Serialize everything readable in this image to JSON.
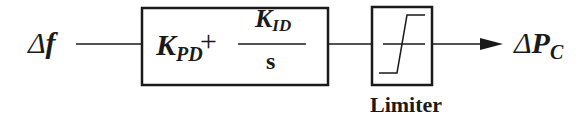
{
  "diagram": {
    "type": "block-diagram",
    "input": {
      "delta": "Δ",
      "symbol": "f"
    },
    "controller": {
      "proportional": {
        "symbol": "K",
        "subscript": "PD"
      },
      "operator": "+",
      "integral": {
        "numerator_symbol": "K",
        "numerator_subscript": "ID",
        "denominator": "s"
      }
    },
    "limiter": {
      "label": "Limiter"
    },
    "output": {
      "delta": "Δ",
      "symbol": "P",
      "subscript": "C"
    },
    "colors": {
      "stroke": "#1a1a1a",
      "background": "#ffffff"
    }
  }
}
